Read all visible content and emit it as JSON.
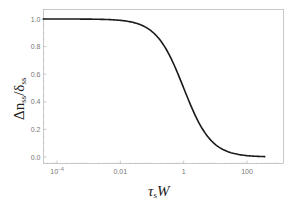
{
  "chart_data": {
    "type": "line",
    "title": "",
    "xlabel": "τ_s W",
    "ylabel": "Δn_ss / δ_ss",
    "xscale": "log",
    "xlim": [
      3e-05,
      1000
    ],
    "ylim": [
      -0.05,
      1.05
    ],
    "xticks": [
      "10^-4",
      "0.01",
      "1",
      "100"
    ],
    "yticks": [
      "0.0",
      "0.2",
      "0.4",
      "0.6",
      "0.8",
      "1.0"
    ],
    "grid": false,
    "legend": null,
    "series": [
      {
        "name": "Δn_ss/δ_ss",
        "color": "#1a1a1a",
        "x": [
          5e-05,
          0.0001,
          0.001,
          0.01,
          0.05,
          0.1,
          0.3,
          1,
          3,
          10,
          30,
          100,
          1000
        ],
        "y": [
          1.0,
          1.0,
          0.999,
          0.99,
          0.952,
          0.909,
          0.769,
          0.5,
          0.25,
          0.091,
          0.032,
          0.01,
          0.001
        ]
      }
    ]
  },
  "labels": {
    "x_label_main": "τ",
    "x_label_sub": "s",
    "x_label_tail": "W",
    "y_label_main": "Δn",
    "y_label_sub1": "ss",
    "y_label_mid": "/δ",
    "y_label_sub2": "ss"
  },
  "ticks": {
    "x": [
      "10",
      "0.01",
      "1",
      "100"
    ],
    "x_exp": "−4",
    "y": [
      "0.0",
      "0.2",
      "0.4",
      "0.6",
      "0.8",
      "1.0"
    ]
  }
}
